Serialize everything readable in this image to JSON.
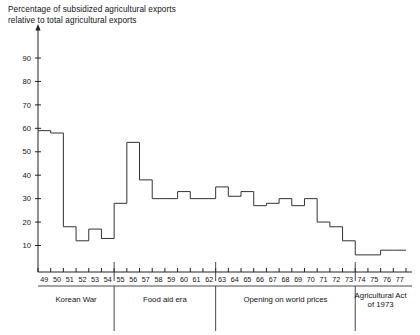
{
  "title": "Percentage of subsidized agricultural exports\nrelative to total agricultural exports",
  "chart_data": {
    "type": "line",
    "title": "Percentage of subsidized agricultural exports relative to total agricultural exports",
    "subtitle": "",
    "xlabel": "",
    "ylabel": "",
    "step": true,
    "grid": false,
    "legend": "none",
    "xlim": [
      49,
      78
    ],
    "ylim": [
      0,
      95
    ],
    "yticks": [
      10,
      20,
      30,
      40,
      50,
      60,
      70,
      80,
      90
    ],
    "ytick_labels": [
      "10",
      "20",
      "30",
      "40",
      "50",
      "60",
      "70",
      "80",
      "90"
    ],
    "categories": [
      "49",
      "50",
      "51",
      "52",
      "53",
      "54",
      "55",
      "56",
      "57",
      "58",
      "59",
      "60",
      "61",
      "62",
      "63",
      "64",
      "65",
      "66",
      "67",
      "68",
      "69",
      "70",
      "71",
      "72",
      "73",
      "74",
      "75",
      "76",
      "77"
    ],
    "values": [
      59,
      58,
      18,
      12,
      17,
      13,
      28,
      54,
      38,
      30,
      30,
      33,
      30,
      30,
      35,
      31,
      33,
      27,
      28,
      30,
      27,
      30,
      20,
      18,
      12,
      6,
      6,
      8,
      8
    ],
    "annotations": [
      {
        "label": "Korean War",
        "from": "49",
        "to": "54"
      },
      {
        "label": "Food aid era",
        "from": "55",
        "to": "62"
      },
      {
        "label": "Opening on world prices",
        "from": "63",
        "to": "73"
      },
      {
        "label": "Agricultural Act\nof 1973",
        "from": "74",
        "to": "77"
      }
    ]
  },
  "eras": [
    {
      "label": "Korean War",
      "line1": "Korean War",
      "line2": ""
    },
    {
      "label": "Food aid era",
      "line1": "Food aid era",
      "line2": ""
    },
    {
      "label": "Opening on world prices",
      "line1": "Opening on world prices",
      "line2": ""
    },
    {
      "label": "Agricultural Act of 1973",
      "line1": "Agricultural Act",
      "line2": "of 1973"
    }
  ],
  "colors": {
    "line": "#333333",
    "axis": "#222222",
    "text": "#111111",
    "background": "#ffffff"
  }
}
